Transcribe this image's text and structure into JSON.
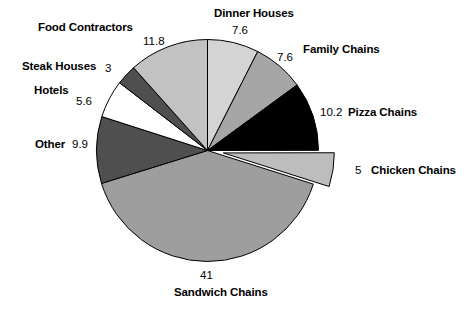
{
  "chart_data": {
    "type": "pie",
    "title": "",
    "subtitle": "",
    "xlabel": "",
    "ylabel": "",
    "legend_position": "none",
    "grid": false,
    "units": "percent",
    "total": 101.7,
    "start_angle_deg": 0,
    "direction": "clockwise",
    "categories": [
      "Dinner Houses",
      "Family Chains",
      "Pizza Chains",
      "Chicken Chains",
      "Sandwich Chains",
      "Other",
      "Hotels",
      "Steak Houses",
      "Food Contractors"
    ],
    "values": [
      7.6,
      7.6,
      10.2,
      5,
      41,
      9.9,
      5.6,
      3,
      11.8
    ],
    "slices": [
      {
        "label": "Dinner Houses",
        "value": 7.6,
        "value_text": "7.6",
        "color": "#d4d4d4",
        "exploded": false
      },
      {
        "label": "Family Chains",
        "value": 7.6,
        "value_text": "7.6",
        "color": "#a6a6a6",
        "exploded": false
      },
      {
        "label": "Pizza Chains",
        "value": 10.2,
        "value_text": "10.2",
        "color": "#000000",
        "exploded": false
      },
      {
        "label": "Chicken Chains",
        "value": 5,
        "value_text": "5",
        "color": "#bdbdbd",
        "exploded": true
      },
      {
        "label": "Sandwich Chains",
        "value": 41,
        "value_text": "41",
        "color": "#9e9e9e",
        "exploded": false
      },
      {
        "label": "Other",
        "value": 9.9,
        "value_text": "9.9",
        "color": "#4f4f4f",
        "exploded": false
      },
      {
        "label": "Hotels",
        "value": 5.6,
        "value_text": "5.6",
        "color": "#ffffff",
        "exploded": false
      },
      {
        "label": "Steak Houses",
        "value": 3,
        "value_text": "3",
        "color": "#4f4f4f",
        "exploded": false
      },
      {
        "label": "Food Contractors",
        "value": 11.8,
        "value_text": "11.8",
        "color": "#c2c2c2",
        "exploded": false
      }
    ],
    "outline_color": "#000000"
  },
  "labels": {
    "dinner_houses": {
      "name": "Dinner Houses",
      "value": "7.6"
    },
    "family_chains": {
      "name": "Family Chains",
      "value": "7.6"
    },
    "pizza_chains": {
      "name": "Pizza Chains",
      "value": "10.2"
    },
    "chicken_chains": {
      "name": "Chicken Chains",
      "value": "5"
    },
    "sandwich_chains": {
      "name": "Sandwich Chains",
      "value": "41"
    },
    "other": {
      "name": "Other",
      "value": "9.9"
    },
    "hotels": {
      "name": "Hotels",
      "value": "5.6"
    },
    "steak_houses": {
      "name": "Steak Houses",
      "value": "3"
    },
    "food_contractors": {
      "name": "Food Contractors",
      "value": "11.8"
    }
  }
}
